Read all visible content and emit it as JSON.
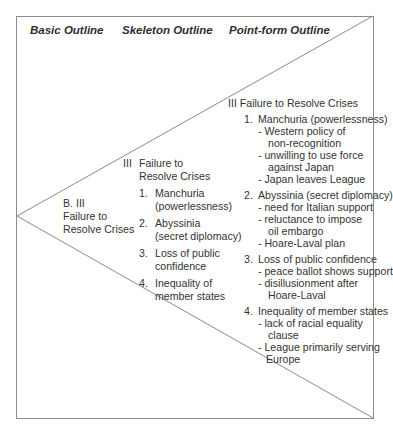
{
  "headers": {
    "basic": "Basic Outline",
    "skeleton": "Skeleton Outline",
    "pointform": "Point-form Outline"
  },
  "basic": {
    "lines": [
      "B. III",
      "Failure to",
      "Resolve Crises"
    ]
  },
  "skeleton": {
    "numeral": "III",
    "title_lines": [
      "Failure to",
      "Resolve Crises"
    ],
    "items": [
      {
        "num": "1.",
        "lines": [
          "Manchuria",
          "(powerlessness)"
        ]
      },
      {
        "num": "2.",
        "lines": [
          "Abyssinia",
          "(secret diplomacy)"
        ]
      },
      {
        "num": "3.",
        "lines": [
          "Loss of public",
          "confidence"
        ]
      },
      {
        "num": "4.",
        "lines": [
          "Inequality of",
          "member states"
        ]
      }
    ]
  },
  "pointform": {
    "title": "III Failure to Resolve Crises",
    "items": [
      {
        "num": "1.",
        "title": "Manchuria (powerlessness)",
        "points": [
          {
            "first": "- Western policy of",
            "cont": "non-recognition"
          },
          {
            "first": "- unwilling to use force",
            "cont": "against Japan"
          },
          {
            "first": "- Japan leaves League"
          }
        ]
      },
      {
        "num": "2.",
        "title": "Abyssinia (secret diplomacy)",
        "points": [
          {
            "first": "- need for Italian support"
          },
          {
            "first": "- reluctance to impose",
            "cont": "oil embargo"
          },
          {
            "first": "- Hoare-Laval plan"
          }
        ]
      },
      {
        "num": "3.",
        "title": "Loss of public confidence",
        "points": [
          {
            "first": "- peace ballot shows support"
          },
          {
            "first": "- disillusionment after",
            "cont": "Hoare-Laval"
          }
        ]
      },
      {
        "num": "4.",
        "title": "Inequality of member states",
        "points": [
          {
            "first": "- lack of racial equality",
            "cont": "clause"
          },
          {
            "first": "- League primarily serving",
            "cont": "Europe"
          }
        ]
      }
    ]
  },
  "colors": {
    "border": "#8c8c8c",
    "text": "#333333"
  }
}
